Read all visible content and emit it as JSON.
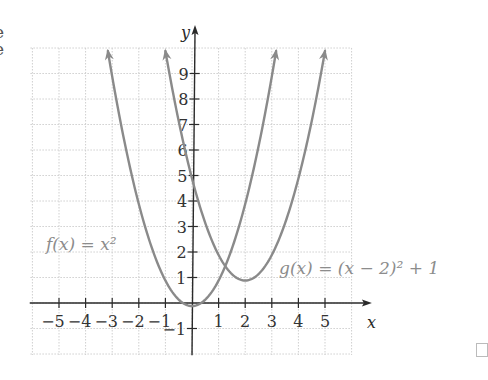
{
  "edge_text": [
    "e",
    "e"
  ],
  "chart_data": {
    "type": "line",
    "title": "",
    "xlabel": "x",
    "ylabel": "y",
    "xlim": [
      -6,
      6
    ],
    "ylim": [
      -2,
      10
    ],
    "grid": true,
    "x_ticks": [
      -5,
      -4,
      -3,
      -2,
      -1,
      1,
      2,
      3,
      4,
      5
    ],
    "y_ticks": [
      -1,
      1,
      2,
      3,
      4,
      5,
      6,
      7,
      8,
      9
    ],
    "series": [
      {
        "name": "f(x) = x^2",
        "label": "f(x) = x²",
        "expression": "x^2",
        "x": [
          -3.16,
          -3,
          -2,
          -1,
          0,
          1,
          2,
          3,
          3.16
        ],
        "values": [
          10,
          9,
          4,
          1,
          0,
          1,
          4,
          9,
          10
        ],
        "color": "#8a8a8a",
        "arrows": "both"
      },
      {
        "name": "g(x) = (x - 2)^2 + 1",
        "label": "g(x) = (x − 2)² + 1",
        "expression": "(x-2)^2+1",
        "x": [
          -1,
          0,
          1,
          2,
          3,
          4,
          5
        ],
        "values": [
          10,
          5,
          2,
          1,
          2,
          5,
          10
        ],
        "color": "#8a8a8a",
        "arrows": "both"
      }
    ],
    "annotations": [
      {
        "text": "f(x) = x²",
        "near": [
          -4.5,
          2.3
        ]
      },
      {
        "text": "g(x) = (x − 2)² + 1",
        "near": [
          3.2,
          1.4
        ]
      }
    ],
    "colors": {
      "axis": "#2a2a2a",
      "grid": "#cfcfcf",
      "curve": "#8a8a8a",
      "label": "#8c8c8c"
    }
  }
}
